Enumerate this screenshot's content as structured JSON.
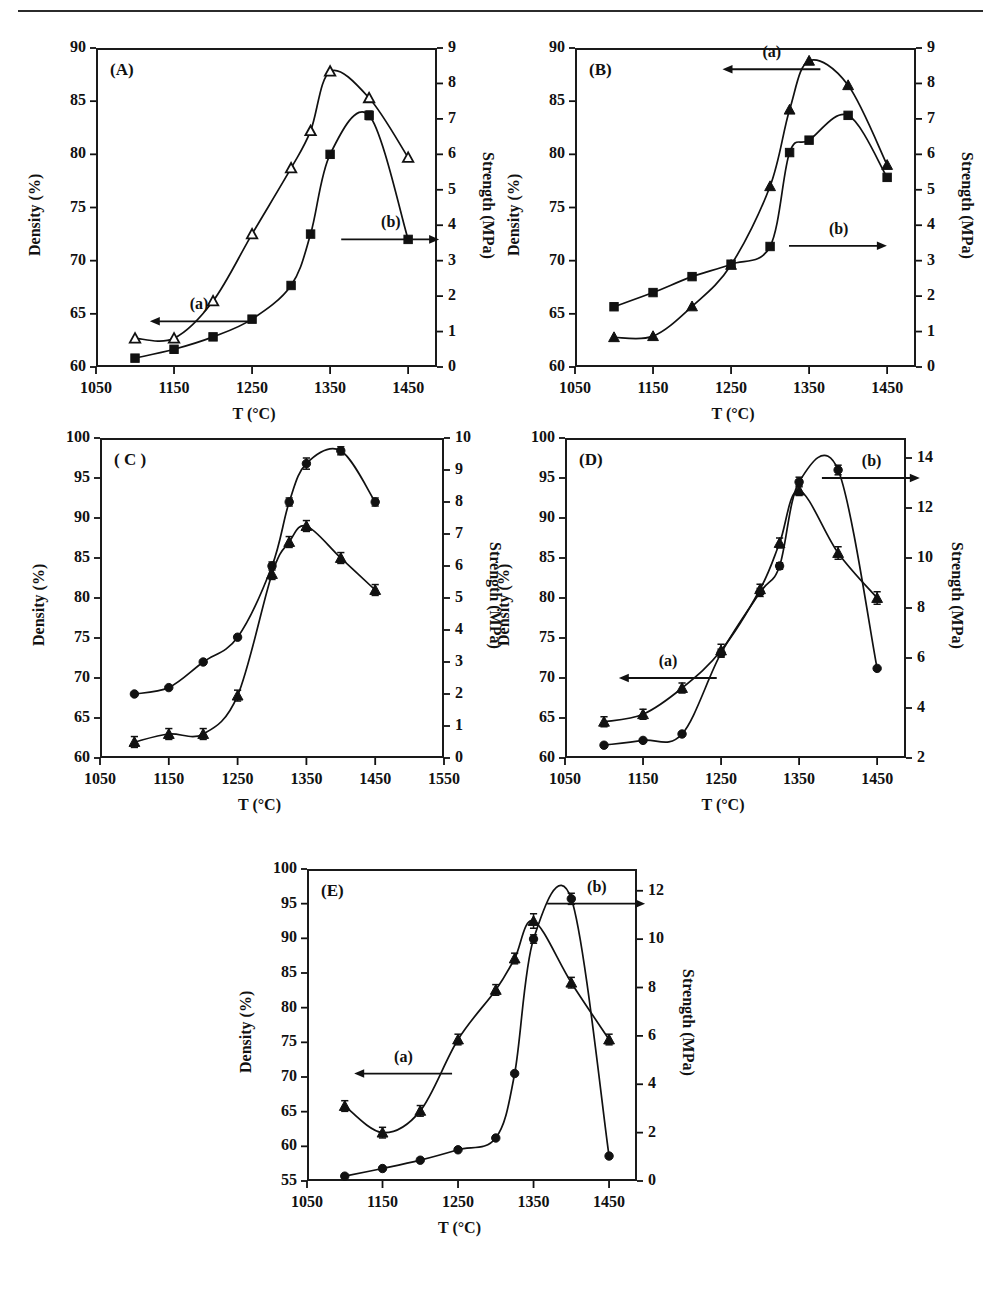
{
  "figure": {
    "background": "#ffffff",
    "line_color": "#111111",
    "marker_color": "#111111",
    "rule_color": "#2b2b2b"
  },
  "common": {
    "xlabel": "T (°C)",
    "ylabel_left": "Density (%)",
    "ylabel_right": "Strength (MPa)",
    "series_a_label": "(a)",
    "series_b_label": "(b)"
  },
  "chart_data": [
    {
      "id": "A",
      "type": "line",
      "title": "(A)",
      "xlabel": "T (°C)",
      "ylabel": "Density (%)",
      "ylabel2": "Strength (MPa)",
      "xlim": [
        1050,
        1487
      ],
      "ylim": [
        60,
        90
      ],
      "ylim2": [
        0,
        9
      ],
      "xticks": [
        1050,
        1150,
        1250,
        1350,
        1450
      ],
      "yticks": [
        60,
        65,
        70,
        75,
        80,
        85,
        90
      ],
      "yticks2": [
        0,
        1,
        2,
        3,
        4,
        5,
        6,
        7,
        8,
        9
      ],
      "grid": false,
      "annotations": [
        {
          "text": "(a)",
          "arrow": "left",
          "x": 1165,
          "y": 64.3
        },
        {
          "text": "(b)",
          "arrow": "right",
          "x": 1400,
          "y": 72.0
        }
      ],
      "series": [
        {
          "name": "(a) Density",
          "marker": "triangle-open",
          "axis": "left",
          "x": [
            1100,
            1150,
            1200,
            1250,
            1300,
            1325,
            1350,
            1400,
            1450
          ],
          "values": [
            62.7,
            62.7,
            66.2,
            72.5,
            78.7,
            82.2,
            87.8,
            85.3,
            79.7
          ]
        },
        {
          "name": "(b) Strength",
          "marker": "square-filled",
          "axis": "right",
          "x": [
            1100,
            1150,
            1200,
            1250,
            1300,
            1325,
            1350,
            1400,
            1450
          ],
          "values": [
            0.25,
            0.5,
            0.85,
            1.35,
            2.3,
            3.75,
            6.0,
            7.1,
            3.6
          ],
          "errors": [
            0,
            0,
            0,
            0,
            0,
            0,
            0,
            0.12,
            0
          ]
        }
      ]
    },
    {
      "id": "B",
      "type": "line",
      "title": "(B)",
      "xlabel": "T (°C)",
      "ylabel": "Density (%)",
      "ylabel2": "Strength (MPa)",
      "xlim": [
        1050,
        1487
      ],
      "ylim": [
        60,
        90
      ],
      "ylim2": [
        0,
        9
      ],
      "xticks": [
        1050,
        1150,
        1250,
        1350,
        1450
      ],
      "yticks": [
        60,
        65,
        70,
        75,
        80,
        85,
        90
      ],
      "yticks2": [
        0,
        1,
        2,
        3,
        4,
        5,
        6,
        7,
        8,
        9
      ],
      "grid": false,
      "annotations": [
        {
          "text": "(a)",
          "arrow": "left",
          "x": 1285,
          "y": 88.0
        },
        {
          "text": "(b)",
          "arrow": "right",
          "x": 1360,
          "y": 71.4
        }
      ],
      "series": [
        {
          "name": "(a) Density",
          "marker": "triangle-filled",
          "axis": "left",
          "x": [
            1100,
            1150,
            1200,
            1250,
            1300,
            1325,
            1350,
            1400,
            1450
          ],
          "values": [
            62.8,
            62.9,
            65.7,
            69.6,
            77.0,
            84.2,
            88.8,
            86.5,
            79.0
          ]
        },
        {
          "name": "(b) Strength",
          "marker": "square-filled",
          "axis": "right",
          "x": [
            1100,
            1150,
            1200,
            1250,
            1300,
            1325,
            1350,
            1400,
            1450
          ],
          "values": [
            1.7,
            2.1,
            2.55,
            2.9,
            3.4,
            6.05,
            6.4,
            7.1,
            5.35
          ]
        }
      ]
    },
    {
      "id": "C",
      "type": "line",
      "title": "( C )",
      "xlabel": "T (°C)",
      "ylabel": "Density (%)",
      "ylabel2": "Strength (MPa)",
      "xlim": [
        1050,
        1550
      ],
      "ylim": [
        60,
        100
      ],
      "ylim2": [
        0,
        10
      ],
      "xticks": [
        1050,
        1150,
        1250,
        1350,
        1450,
        1550
      ],
      "yticks": [
        60,
        65,
        70,
        75,
        80,
        85,
        90,
        95,
        100
      ],
      "yticks2": [
        0,
        1,
        2,
        3,
        4,
        5,
        6,
        7,
        8,
        9,
        10
      ],
      "grid": false,
      "annotations": [],
      "series": [
        {
          "name": "(a) Density",
          "marker": "circle-filled",
          "axis": "left",
          "x": [
            1100,
            1150,
            1200,
            1250,
            1300,
            1325,
            1350,
            1400,
            1450
          ],
          "values": [
            68.0,
            68.8,
            72.0,
            75.1,
            84.0,
            92.0,
            96.8,
            98.4,
            92.0
          ],
          "errors": [
            0,
            0,
            0,
            0,
            0.5,
            0.5,
            0.7,
            0.5,
            0.5
          ]
        },
        {
          "name": "(b) Strength",
          "marker": "triangle-filled",
          "axis": "right",
          "x": [
            1100,
            1150,
            1200,
            1250,
            1300,
            1325,
            1350,
            1400,
            1450
          ],
          "values": [
            0.5,
            0.75,
            0.75,
            1.95,
            5.75,
            6.75,
            7.25,
            6.25,
            5.25
          ],
          "errors": [
            0.17,
            0.17,
            0.17,
            0.17,
            0.17,
            0.17,
            0.17,
            0.17,
            0.17
          ]
        }
      ]
    },
    {
      "id": "D",
      "type": "line",
      "title": "(D)",
      "xlabel": "T (°C)",
      "ylabel": "Density (%)",
      "ylabel2": "Strength (MPa)",
      "xlim": [
        1050,
        1487
      ],
      "ylim": [
        60,
        100
      ],
      "ylim2": [
        2,
        14.8
      ],
      "xticks": [
        1050,
        1150,
        1250,
        1350,
        1450
      ],
      "yticks": [
        60,
        65,
        70,
        75,
        80,
        85,
        90,
        95,
        100
      ],
      "yticks2": [
        2,
        4,
        6,
        8,
        10,
        12,
        14
      ],
      "grid": false,
      "annotations": [
        {
          "text": "(a)",
          "arrow": "left",
          "x": 1165,
          "y": 70.0
        },
        {
          "text": "(b)",
          "arrow": "right",
          "x": 1415,
          "y": 95.0
        }
      ],
      "series": [
        {
          "name": "(a) Density",
          "marker": "circle-filled",
          "axis": "left",
          "x": [
            1100,
            1150,
            1200,
            1250,
            1300,
            1325,
            1350,
            1400,
            1450
          ],
          "values": [
            61.6,
            62.2,
            63.0,
            73.1,
            80.7,
            84.0,
            94.5,
            96.0,
            71.2
          ],
          "errors": [
            0,
            0,
            0,
            0.5,
            0.5,
            0.4,
            0.6,
            0.6,
            0
          ]
        },
        {
          "name": "(b) Strength",
          "marker": "triangle-filled",
          "axis": "right",
          "x": [
            1100,
            1150,
            1200,
            1250,
            1300,
            1325,
            1350,
            1400,
            1450
          ],
          "values": [
            3.45,
            3.75,
            4.8,
            6.3,
            8.75,
            10.6,
            12.7,
            10.2,
            8.4
          ],
          "errors": [
            0.2,
            0.2,
            0.2,
            0.25,
            0.2,
            0.2,
            0.2,
            0.25,
            0.25
          ]
        }
      ]
    },
    {
      "id": "E",
      "type": "line",
      "title": "(E)",
      "xlabel": "T (°C)",
      "ylabel": "Density (%)",
      "ylabel2": "Strength (MPa)",
      "xlim": [
        1050,
        1487
      ],
      "ylim": [
        55,
        100
      ],
      "ylim2": [
        0,
        12.9
      ],
      "xticks": [
        1050,
        1150,
        1250,
        1350,
        1450
      ],
      "yticks": [
        55,
        60,
        65,
        70,
        75,
        80,
        85,
        90,
        95,
        100
      ],
      "yticks2": [
        0,
        2,
        4,
        6,
        8,
        10,
        12
      ],
      "grid": false,
      "annotations": [
        {
          "text": "(a)",
          "arrow": "left",
          "x": 1160,
          "y": 70.5
        },
        {
          "text": "(b)",
          "arrow": "right",
          "x": 1405,
          "y": 95.0
        }
      ],
      "series": [
        {
          "name": "(a) Density",
          "marker": "circle-filled",
          "axis": "left",
          "x": [
            1100,
            1150,
            1200,
            1250,
            1300,
            1325,
            1350,
            1400,
            1450
          ],
          "values": [
            55.7,
            56.8,
            58.0,
            59.5,
            61.2,
            70.5,
            89.9,
            95.7,
            58.6
          ],
          "errors": [
            0,
            0,
            0,
            0,
            0,
            0,
            0.6,
            0.8,
            0
          ]
        },
        {
          "name": "(b) Strength",
          "marker": "triangle-filled",
          "axis": "right",
          "x": [
            1100,
            1150,
            1200,
            1250,
            1300,
            1325,
            1350,
            1400,
            1450
          ],
          "values": [
            3.1,
            2.0,
            2.9,
            5.85,
            7.9,
            9.2,
            10.75,
            8.2,
            5.85
          ],
          "errors": [
            0.22,
            0.22,
            0.22,
            0.22,
            0.22,
            0.22,
            0.3,
            0.22,
            0.22
          ]
        }
      ]
    }
  ]
}
